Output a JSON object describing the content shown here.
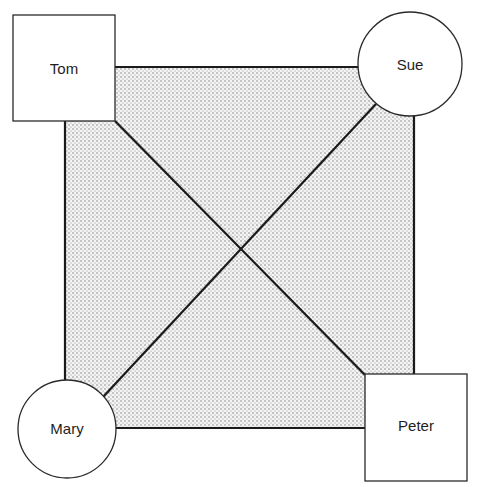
{
  "diagram": {
    "type": "communication-network",
    "background_fill": "stippled-gray",
    "nodes": [
      {
        "id": "tom",
        "label": "Tom",
        "shape": "square",
        "position": "top-left"
      },
      {
        "id": "sue",
        "label": "Sue",
        "shape": "circle",
        "position": "top-right"
      },
      {
        "id": "mary",
        "label": "Mary",
        "shape": "circle",
        "position": "bottom-left"
      },
      {
        "id": "peter",
        "label": "Peter",
        "shape": "square",
        "position": "bottom-right"
      }
    ],
    "edges": [
      {
        "from": "tom",
        "to": "sue"
      },
      {
        "from": "sue",
        "to": "peter"
      },
      {
        "from": "peter",
        "to": "mary"
      },
      {
        "from": "mary",
        "to": "tom"
      },
      {
        "from": "tom",
        "to": "peter"
      },
      {
        "from": "sue",
        "to": "mary"
      }
    ]
  },
  "colors": {
    "stroke": "#1a1a1a",
    "node_fill": "#ffffff",
    "stipple_dot": "#6e6e6e",
    "stipple_bg": "#f4f4f4"
  }
}
